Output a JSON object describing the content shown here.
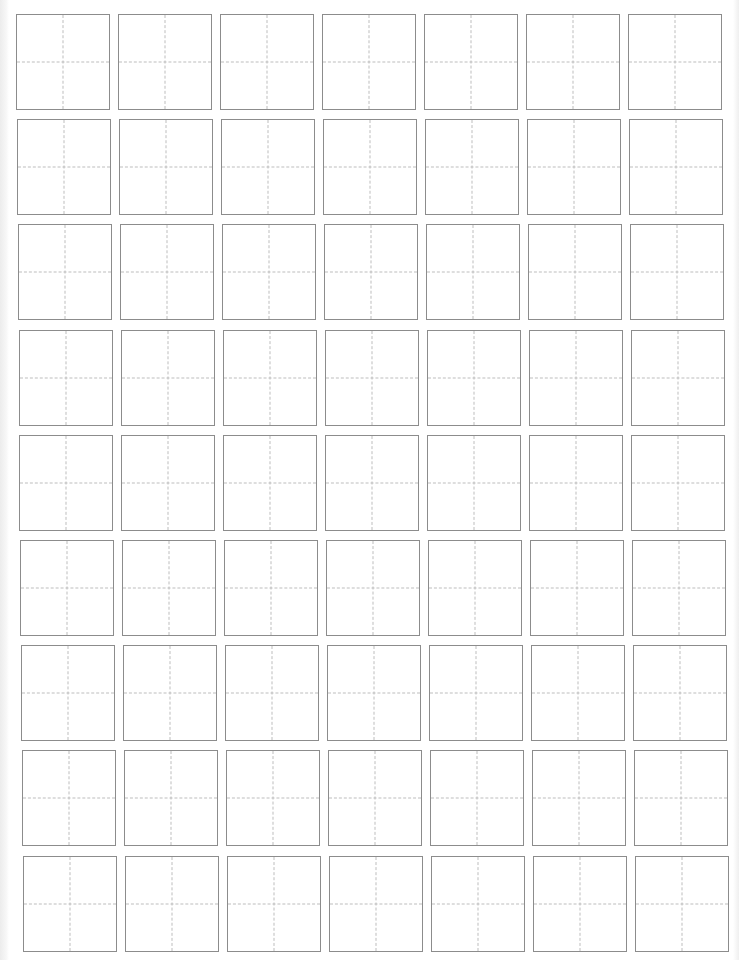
{
  "sheet": {
    "type": "tianzige-practice-grid",
    "rows": 9,
    "columns": 7,
    "cell_width": 94,
    "cell_height": 96,
    "origin_x": 16,
    "origin_y": 14,
    "column_pitch": 102,
    "row_pitch": 105.2,
    "row_skew_x": 0.85,
    "colors": {
      "cell_border": "#8c8c8c",
      "guide_line": "#bdbdbd",
      "background": "#ffffff"
    },
    "cells_content": [
      [
        "",
        "",
        "",
        "",
        "",
        "",
        ""
      ],
      [
        "",
        "",
        "",
        "",
        "",
        "",
        ""
      ],
      [
        "",
        "",
        "",
        "",
        "",
        "",
        ""
      ],
      [
        "",
        "",
        "",
        "",
        "",
        "",
        ""
      ],
      [
        "",
        "",
        "",
        "",
        "",
        "",
        ""
      ],
      [
        "",
        "",
        "",
        "",
        "",
        "",
        ""
      ],
      [
        "",
        "",
        "",
        "",
        "",
        "",
        ""
      ],
      [
        "",
        "",
        "",
        "",
        "",
        "",
        ""
      ],
      [
        "",
        "",
        "",
        "",
        "",
        "",
        ""
      ]
    ]
  }
}
